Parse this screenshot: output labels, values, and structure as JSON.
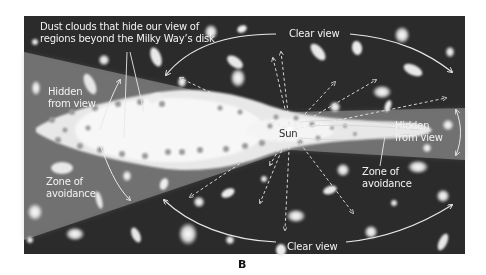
{
  "figure": {
    "panel_label": "B",
    "colors": {
      "space": "#2b2b2b",
      "zone_of_avoidance": "#6e6e6e",
      "disk": "#e6e6e6",
      "dust_spots": "#9a9a9a",
      "text": "#f2f2f2",
      "arrows": "#e8e8e8"
    }
  },
  "labels": {
    "dust_clouds": {
      "line1": "Dust clouds that hide our view of",
      "line2": "regions beyond the Milky Way’s disk"
    },
    "clear_view_top": "Clear view",
    "clear_view_bottom": "Clear view",
    "hidden_left": {
      "line1": "Hidden",
      "line2": "from view"
    },
    "hidden_right": {
      "line1": "Hidden",
      "line2": "from view"
    },
    "zone_left": {
      "line1": "Zone of",
      "line2": "avoidance"
    },
    "zone_right": {
      "line1": "Zone of",
      "line2": "avoidance"
    },
    "sun": "Sun"
  }
}
